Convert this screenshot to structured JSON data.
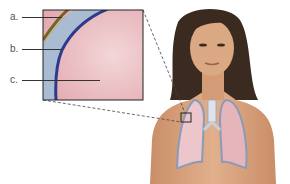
{
  "figure": {
    "labels": [
      {
        "id": "a",
        "text": "a."
      },
      {
        "id": "b",
        "text": "b."
      },
      {
        "id": "c",
        "text": "c."
      }
    ],
    "colors": {
      "parietal_layer": "#7a6320",
      "pleural_cavity": "#9fb3cc",
      "visceral_line": "#2e3a8c",
      "lung_tissue": "#e9b9be",
      "skin": "#d9a27a",
      "hair": "#3a2a20"
    }
  }
}
